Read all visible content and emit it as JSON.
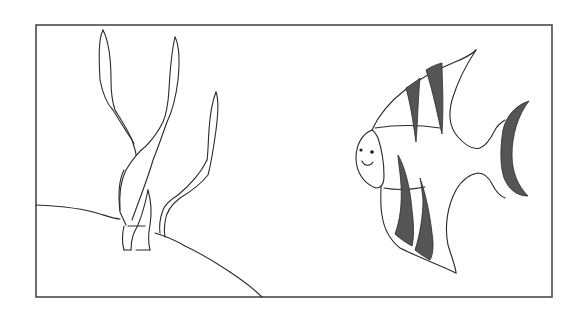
{
  "scene": {
    "description": "Line drawing of an angelfish beside seaweed on a sloping seabed, inside a rectangular frame",
    "colors": {
      "background": "#ffffff",
      "ink": "#2a2a2a",
      "frame": "#4a4a4a",
      "stripe_fill": "#555555"
    },
    "frame": {
      "x": 36,
      "y": 25,
      "width": 516,
      "height": 272
    },
    "elements": [
      "seaweed",
      "seabed",
      "angelfish"
    ]
  }
}
